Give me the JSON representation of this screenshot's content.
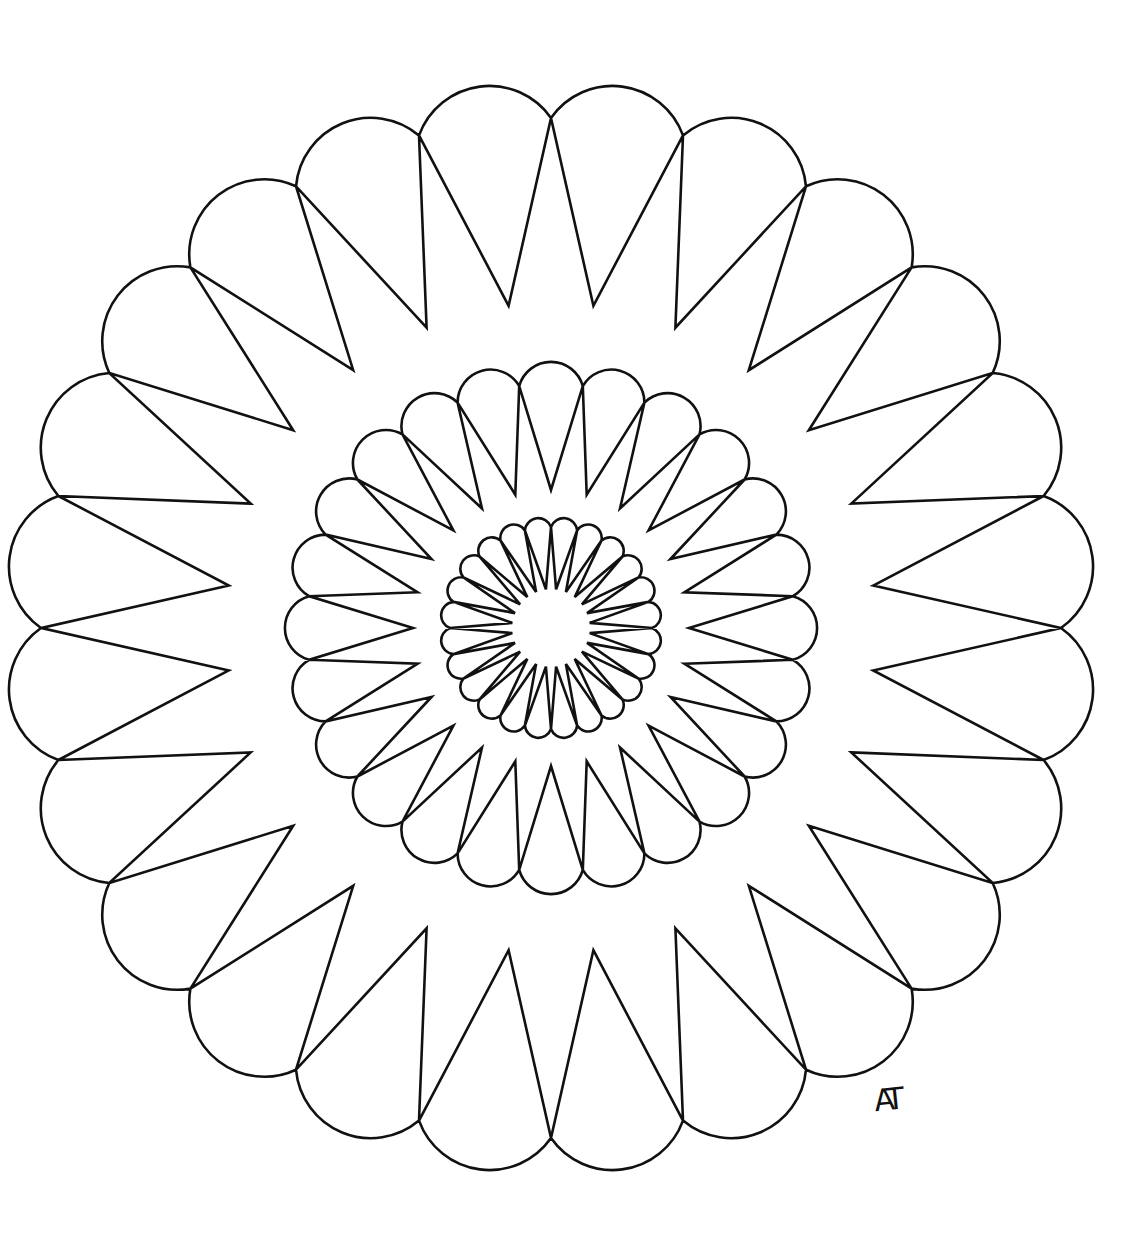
{
  "artwork": {
    "title": "Mandala coloring page",
    "stroke_color": "#111111",
    "background_color": "#ffffff",
    "stroke_width": 2.6,
    "center": [
      551,
      628
    ],
    "rings": [
      {
        "name": "outer-ring",
        "petals": 24,
        "junction_radius": 510,
        "tip_radius": 325,
        "lobe_arc_radius": 75,
        "rotation_deg": 0
      },
      {
        "name": "middle-ring",
        "petals": 24,
        "junction_radius": 244,
        "tip_radius": 138,
        "lobe_arc_radius": 33,
        "rotation_deg": 7.5
      },
      {
        "name": "inner-ring",
        "petals": 24,
        "junction_radius": 101,
        "tip_radius": 39,
        "lobe_arc_radius": 13.5,
        "rotation_deg": 0
      }
    ]
  },
  "signature": {
    "text": "AT"
  }
}
